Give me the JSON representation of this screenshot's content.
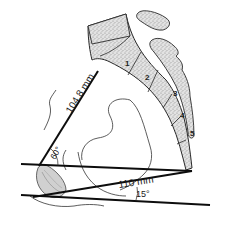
{
  "diagram": {
    "measurements": {
      "length_1": "104.8 mm",
      "length_2": "110 mm",
      "angle_1": "60°",
      "angle_2": "15°"
    },
    "vertebrae": [
      "1",
      "2",
      "3",
      "4",
      "5"
    ],
    "colors": {
      "line": "#0d0d0d",
      "outline": "#2a2a2a",
      "bone_fill": "#d9d9d9",
      "background": "#ffffff"
    }
  }
}
